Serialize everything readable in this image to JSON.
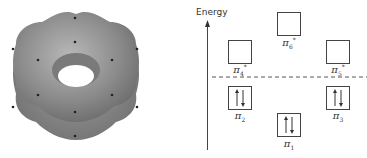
{
  "figure": {
    "left_panel": {
      "description": "Benzene pi electron density torus with 12 atom dots",
      "colors": {
        "surface": "#8a8a8a",
        "dots": "#222222"
      }
    },
    "axis": {
      "label": "Energy"
    },
    "orbitals": [
      {
        "id": "pi1",
        "symbol": "π",
        "subscript": "1",
        "star": false,
        "occupancy": "↑↓"
      },
      {
        "id": "pi2",
        "symbol": "π",
        "subscript": "2",
        "star": false,
        "occupancy": "↑↓"
      },
      {
        "id": "pi3",
        "symbol": "π",
        "subscript": "3",
        "star": false,
        "occupancy": "↑↓"
      },
      {
        "id": "pi4",
        "symbol": "π",
        "subscript": "4",
        "star": true,
        "occupancy": ""
      },
      {
        "id": "pi5",
        "symbol": "π",
        "subscript": "5",
        "star": true,
        "occupancy": ""
      },
      {
        "id": "pi6",
        "symbol": "π",
        "subscript": "6",
        "star": true,
        "occupancy": ""
      }
    ],
    "star_mark": "*"
  }
}
